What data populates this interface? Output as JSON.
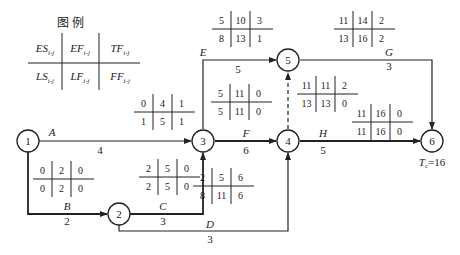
{
  "legend": {
    "title": "图  例",
    "cells": [
      [
        "ES",
        "EF",
        "TF"
      ],
      [
        "LS",
        "LF",
        "FF"
      ]
    ],
    "subscript": "i-j"
  },
  "nodes": [
    {
      "id": "1",
      "label": "1"
    },
    {
      "id": "2",
      "label": "2"
    },
    {
      "id": "3",
      "label": "3"
    },
    {
      "id": "4",
      "label": "4"
    },
    {
      "id": "5",
      "label": "5"
    },
    {
      "id": "6",
      "label": "6"
    }
  ],
  "activities": [
    {
      "name": "A",
      "duration": "4",
      "from": "1",
      "to": "3",
      "params": [
        [
          "0",
          "4",
          "1"
        ],
        [
          "1",
          "5",
          "1"
        ]
      ]
    },
    {
      "name": "B",
      "duration": "2",
      "from": "1",
      "to": "2",
      "params": [
        [
          "0",
          "2",
          "0"
        ],
        [
          "0",
          "2",
          "0"
        ]
      ]
    },
    {
      "name": "C",
      "duration": "3",
      "from": "2",
      "to": "3",
      "params": [
        [
          "2",
          "5",
          "0"
        ],
        [
          "2",
          "5",
          "0"
        ]
      ]
    },
    {
      "name": "D",
      "duration": "3",
      "from": "2",
      "to": "4",
      "params": [
        [
          "2",
          "5",
          "6"
        ],
        [
          "8",
          "11",
          "6"
        ]
      ]
    },
    {
      "name": "E",
      "duration": "5",
      "from": "3",
      "to": "5",
      "params": [
        [
          "5",
          "10",
          "3"
        ],
        [
          "8",
          "13",
          "1"
        ]
      ]
    },
    {
      "name": "F",
      "duration": "6",
      "from": "3",
      "to": "4",
      "params": [
        [
          "5",
          "11",
          "0"
        ],
        [
          "5",
          "11",
          "0"
        ]
      ]
    },
    {
      "name": "dummy",
      "duration": "",
      "from": "4",
      "to": "5",
      "params": [
        [
          "11",
          "11",
          "2"
        ],
        [
          "13",
          "13",
          "0"
        ]
      ]
    },
    {
      "name": "G",
      "duration": "3",
      "from": "5",
      "to": "6",
      "params": [
        [
          "11",
          "14",
          "2"
        ],
        [
          "13",
          "16",
          "2"
        ]
      ]
    },
    {
      "name": "H",
      "duration": "5",
      "from": "4",
      "to": "6",
      "params": [
        [
          "11",
          "16",
          "0"
        ],
        [
          "11",
          "16",
          "0"
        ]
      ]
    }
  ],
  "tc": {
    "label": "T",
    "sub": "c",
    "value": "=16"
  }
}
